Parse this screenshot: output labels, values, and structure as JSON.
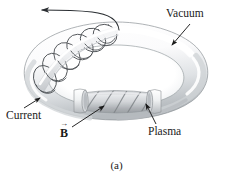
{
  "figure": {
    "caption": "(a)",
    "background_color": "#ffffff",
    "ink_color": "#1a1a1a",
    "labels": {
      "vacuum": "Vacuum",
      "current": "Current",
      "plasma": "Plasma",
      "b_field_symbol": "B",
      "b_field_vector_arrow": "→"
    },
    "colors": {
      "torus_light": "#ffffff",
      "torus_mid": "#e6e8ea",
      "torus_shadow": "#b9bdc1",
      "torus_outline": "#6e7276",
      "plasma_light": "#d8dadc",
      "plasma_mid": "#b4b8bb",
      "plasma_stripe": "#8e9295",
      "coil_line": "#4a4e52",
      "annotation_line": "#1a1a1a"
    },
    "elements": {
      "torus": "toroidal-vacuum-vessel",
      "coil": "helical-current-coil-winding",
      "plasma_section": "gray-plasma-column-with-helical-field-lines",
      "current_arrow_top": "current-direction-arrow-exiting-coil",
      "collar_left": "left-plasma-collar-ring",
      "collar_right": "right-plasma-collar-ring"
    }
  }
}
